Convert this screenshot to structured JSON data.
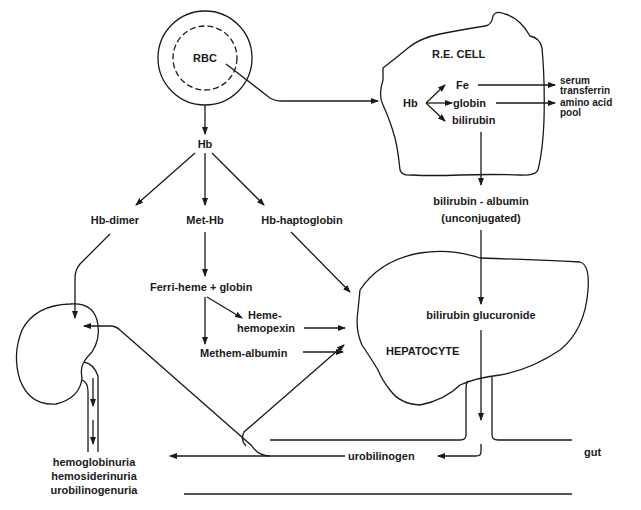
{
  "diagram": {
    "nodes": {
      "rbc": "RBC",
      "hb": "Hb",
      "hb_dimer": "Hb-dimer",
      "met_hb": "Met-Hb",
      "hb_haptoglobin": "Hb-haptoglobin",
      "ferri_heme": "Ferri-heme + globin",
      "heme_hemopexin_1": "Heme-",
      "heme_hemopexin_2": "hemopexin",
      "methem_albumin": "Methem-albumin",
      "re_cell": "R.E. CELL",
      "re_hb": "Hb",
      "re_fe": "Fe",
      "re_globin": "globin",
      "re_bilirubin": "bilirubin",
      "serum_transferrin_1": "serum",
      "serum_transferrin_2": "transferrin",
      "amino_acid_pool_1": "amino acid",
      "amino_acid_pool_2": "pool",
      "bilirubin_albumin": "bilirubin - albumin",
      "unconjugated": "(unconjugated)",
      "bilirubin_glucuronide": "bilirubin glucuronide",
      "hepatocyte": "HEPATOCYTE",
      "urobilinogen": "urobilinogen",
      "gut": "gut",
      "urine_1": "hemoglobinuria",
      "urine_2": "hemosiderinuria",
      "urine_3": "urobilinogenuria"
    },
    "edges": [
      {
        "from": "RBC",
        "to": "Hb"
      },
      {
        "from": "RBC",
        "to": "R.E. CELL"
      },
      {
        "from": "Hb",
        "to": "Hb-dimer"
      },
      {
        "from": "Hb",
        "to": "Met-Hb"
      },
      {
        "from": "Hb",
        "to": "Hb-haptoglobin"
      },
      {
        "from": "Hb-dimer",
        "to": "kidney"
      },
      {
        "from": "Met-Hb",
        "to": "Ferri-heme + globin"
      },
      {
        "from": "Ferri-heme + globin",
        "to": "Heme-hemopexin"
      },
      {
        "from": "Ferri-heme + globin",
        "to": "Methem-albumin"
      },
      {
        "from": "Heme-hemopexin",
        "to": "HEPATOCYTE"
      },
      {
        "from": "Methem-albumin",
        "to": "HEPATOCYTE"
      },
      {
        "from": "Hb-haptoglobin",
        "to": "HEPATOCYTE"
      },
      {
        "from": "Hb (R.E.)",
        "to": "Fe"
      },
      {
        "from": "Hb (R.E.)",
        "to": "globin"
      },
      {
        "from": "Hb (R.E.)",
        "to": "bilirubin"
      },
      {
        "from": "Fe",
        "to": "serum transferrin"
      },
      {
        "from": "globin",
        "to": "amino acid pool"
      },
      {
        "from": "bilirubin",
        "to": "bilirubin - albumin (unconjugated)"
      },
      {
        "from": "bilirubin - albumin (unconjugated)",
        "to": "bilirubin glucuronide"
      },
      {
        "from": "bilirubin glucuronide",
        "to": "gut"
      },
      {
        "from": "gut",
        "to": "urobilinogen"
      },
      {
        "from": "urobilinogen",
        "to": "kidney"
      },
      {
        "from": "urobilinogen",
        "to": "HEPATOCYTE"
      },
      {
        "from": "kidney",
        "to": "hemoglobinuria / hemosiderinuria / urobilinogenuria"
      }
    ]
  },
  "colors": {
    "ink": "#1a1a1a",
    "background": "#ffffff"
  }
}
